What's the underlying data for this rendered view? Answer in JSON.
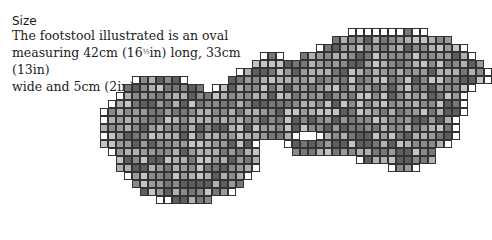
{
  "heading": "Size",
  "description": {
    "line1": "The footstool illustrated is an oval",
    "line2a": "measuring 42cm (16",
    "frac": "½",
    "line2b": "in) long, 33cm (13in)",
    "line3": "wide and 5cm (2in) deep"
  },
  "grid": {
    "origin_x": 92,
    "origin_y": 28,
    "cell": 8,
    "colors": [
      "#ffffff",
      "#b0b0b0",
      "#9a9a9a",
      "#8a8a8a",
      "#777777",
      "#5e5e5e",
      "#c4c4c4"
    ],
    "rows": [
      [
        [
          32,
          41
        ]
      ],
      [
        [
          30,
          44
        ]
      ],
      [
        [
          28,
          46
        ]
      ],
      [
        [
          21,
          23
        ],
        [
          26,
          47
        ]
      ],
      [
        [
          20,
          48
        ]
      ],
      [
        [
          18,
          49
        ]
      ],
      [
        [
          5,
          11
        ],
        [
          17,
          49
        ]
      ],
      [
        [
          4,
          13
        ],
        [
          15,
          47
        ]
      ],
      [
        [
          3,
          46
        ]
      ],
      [
        [
          2,
          46
        ]
      ],
      [
        [
          1,
          46
        ]
      ],
      [
        [
          1,
          45
        ]
      ],
      [
        [
          1,
          45
        ]
      ],
      [
        [
          1,
          25
        ],
        [
          28,
          45
        ]
      ],
      [
        [
          1,
          20
        ],
        [
          24,
          44
        ]
      ],
      [
        [
          2,
          20
        ],
        [
          25,
          42
        ]
      ],
      [
        [
          3,
          20
        ],
        [
          33,
          42
        ]
      ],
      [
        [
          3,
          20
        ],
        [
          37,
          40
        ]
      ],
      [
        [
          4,
          19
        ]
      ],
      [
        [
          5,
          18
        ]
      ],
      [
        [
          6,
          17
        ]
      ],
      [
        [
          8,
          14
        ]
      ]
    ]
  }
}
